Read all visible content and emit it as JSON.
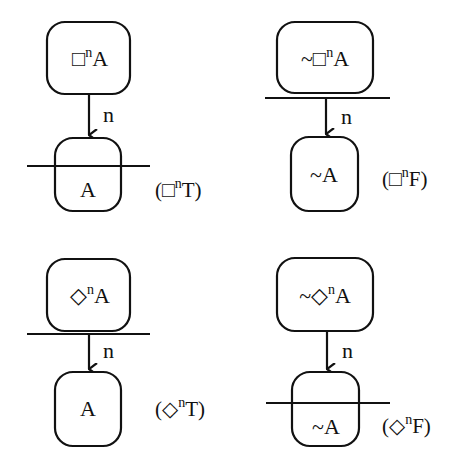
{
  "diagram": {
    "type": "tableau-rules",
    "stroke_color": "#111111",
    "background": "#ffffff",
    "rules": [
      {
        "id": "box-n-true",
        "premise": {
          "neg": "",
          "op": "□",
          "sup": "n",
          "arg": "A"
        },
        "edge_label": "n",
        "conclusion": {
          "neg": "",
          "arg": "A"
        },
        "bar_position": "through-conclusion",
        "rule_name": {
          "open": "(",
          "op": "□",
          "sup": "n",
          "tv": "T",
          "close": ")"
        }
      },
      {
        "id": "box-n-false",
        "premise": {
          "neg": "~",
          "op": "□",
          "sup": "n",
          "arg": "A"
        },
        "edge_label": "n",
        "conclusion": {
          "neg": "~",
          "arg": "A"
        },
        "bar_position": "below-premise",
        "rule_name": {
          "open": "(",
          "op": "□",
          "sup": "n",
          "tv": "F",
          "close": ")"
        }
      },
      {
        "id": "diamond-n-true",
        "premise": {
          "neg": "",
          "op": "◇",
          "sup": "n",
          "arg": "A"
        },
        "edge_label": "n",
        "conclusion": {
          "neg": "",
          "arg": "A"
        },
        "bar_position": "below-premise",
        "rule_name": {
          "open": "(",
          "op": "◇",
          "sup": "n",
          "tv": "T",
          "close": ")"
        }
      },
      {
        "id": "diamond-n-false",
        "premise": {
          "neg": "~",
          "op": "◇",
          "sup": "n",
          "arg": "A"
        },
        "edge_label": "n",
        "conclusion": {
          "neg": "~",
          "arg": "A"
        },
        "bar_position": "through-conclusion",
        "rule_name": {
          "open": "(",
          "op": "◇",
          "sup": "n",
          "tv": "F",
          "close": ")"
        }
      }
    ]
  }
}
